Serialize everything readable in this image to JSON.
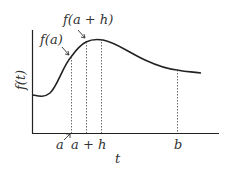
{
  "diagram": {
    "y_axis_label": "f(t)",
    "x_axis_label": "t",
    "ticks": [
      {
        "label": "a",
        "x": 71
      },
      {
        "label": "a + h",
        "x": 86
      },
      {
        "label": "b",
        "x": 177
      }
    ],
    "annotations": [
      {
        "label": "f(a)",
        "target": "point at t=a"
      },
      {
        "label": "f(a + h)",
        "target": "point at t=a+h"
      }
    ],
    "curve_color": "#222222",
    "guide_line_style": "dotted"
  }
}
